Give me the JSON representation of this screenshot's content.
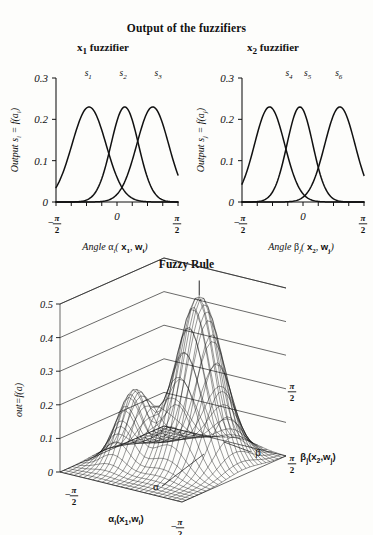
{
  "figure": {
    "main_title": "Output of the fuzzifiers",
    "fuzzy_rule_title": "Fuzzy Rule",
    "subtitle_left": "x₁ fuzzifier",
    "subtitle_right": "x₂ fuzzifier"
  },
  "chart_data": [
    {
      "type": "line",
      "id": "x1-fuzzifier",
      "title": "x₁ fuzzifier",
      "xlabel": "Angle αi( x1, wi)",
      "ylabel": "Output si = f(ai)",
      "xlim": [
        -1.5708,
        1.5708
      ],
      "ylim": [
        0,
        0.3
      ],
      "xticks": [
        -1.5708,
        0,
        1.5708
      ],
      "xticklabels": [
        "-π/2",
        "0",
        "π/2"
      ],
      "yticks": [
        0,
        0.1,
        0.2,
        0.3
      ],
      "yticklabels": [
        "0",
        "0.1",
        "0.2",
        "0.3"
      ],
      "grid": false,
      "legend": "none",
      "annotations": [
        "s₁",
        "s₂",
        "s₃"
      ],
      "series": [
        {
          "name": "s1",
          "label": "s 1",
          "peak_x": -0.72,
          "peak_y": 0.23,
          "sigma": 0.62,
          "label_x": -0.74
        },
        {
          "name": "s2",
          "label": "s 2",
          "peak_x": 0.2,
          "peak_y": 0.23,
          "sigma": 0.5,
          "label_x": 0.16
        },
        {
          "name": "s3",
          "label": "s 3",
          "peak_x": 0.92,
          "peak_y": 0.23,
          "sigma": 0.58,
          "label_x": 1.06
        }
      ]
    },
    {
      "type": "line",
      "id": "x2-fuzzifier",
      "title": "x₂ fuzzifier",
      "xlabel": "Angle βj( x2, wj)",
      "ylabel": "Output sj = f(aj)",
      "xlim": [
        -1.5708,
        1.5708
      ],
      "ylim": [
        0,
        0.3
      ],
      "xticks": [
        -1.5708,
        0,
        1.5708
      ],
      "xticklabels": [
        "-π/2",
        "0",
        "π/2"
      ],
      "yticks": [
        0,
        0.1,
        0.2,
        0.3
      ],
      "yticklabels": [
        "0",
        "0.1",
        "0.2",
        "0.3"
      ],
      "grid": false,
      "legend": "none",
      "annotations": [
        "s₄",
        "s₅",
        "s₆"
      ],
      "series": [
        {
          "name": "s4",
          "label": "s 4",
          "peak_x": -0.86,
          "peak_y": 0.23,
          "sigma": 0.55,
          "label_x": -0.36
        },
        {
          "name": "s5",
          "label": "s 5",
          "peak_x": -0.08,
          "peak_y": 0.23,
          "sigma": 0.47,
          "label_x": 0.12
        },
        {
          "name": "s6",
          "label": "s 6",
          "peak_x": 0.95,
          "peak_y": 0.23,
          "sigma": 0.55,
          "label_x": 0.92
        }
      ]
    },
    {
      "type": "surface",
      "id": "fuzzy-rule-surface",
      "title": "Fuzzy Rule",
      "zlabel": "out=f(a)",
      "xlabel": "αi(x1,wi)",
      "ylabel": "βj(x2,wj)",
      "x_axis_greek": "α",
      "y_axis_greek": "β",
      "xlim": [
        -1.5708,
        1.5708
      ],
      "ylim": [
        -1.5708,
        1.5708
      ],
      "zlim": [
        0,
        0.5
      ],
      "zticks": [
        0,
        0.1,
        0.2,
        0.3,
        0.4,
        0.5
      ],
      "zticklabels": [
        "0",
        "0.1",
        "0.2",
        "0.3",
        "0.4",
        "0.5"
      ],
      "xticklabels": [
        "-π/2",
        "π/2"
      ],
      "yticklabels": [
        "-π/2",
        "π/2"
      ],
      "grid": true,
      "mesh_n": 26,
      "peaks": [
        {
          "name": "main-peak",
          "x": 0.42,
          "y": 0.3,
          "height": 0.5,
          "sx": 0.62,
          "sy": 0.7
        },
        {
          "name": "secondary-bump",
          "x": -0.72,
          "y": -0.34,
          "height": 0.21,
          "sx": 0.46,
          "sy": 0.52
        }
      ]
    }
  ]
}
